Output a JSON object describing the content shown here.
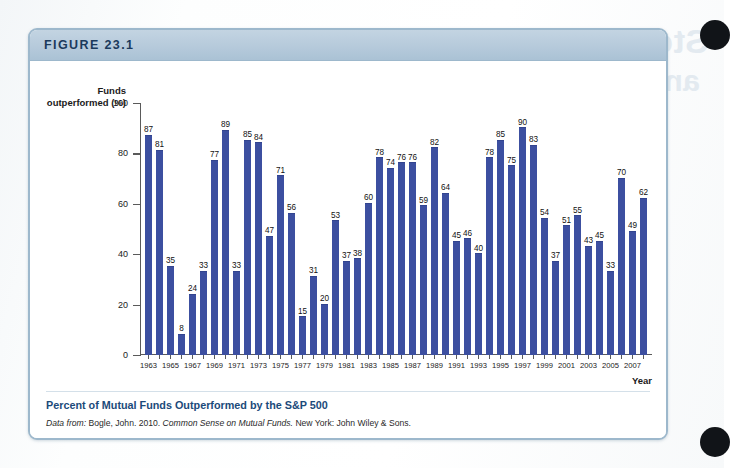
{
  "figure": {
    "header_label": "FIGURE 23.1",
    "caption_title": "Percent of Mutual Funds Outperformed by the S&P 500",
    "source_prefix": "Data from:",
    "source_author": "Bogle, John. 2010.",
    "source_work": "Common Sense on Mutual Funds.",
    "source_publisher": "New York: John Wiley & Sons."
  },
  "bleed_through": {
    "line1": "Stock",
    "line2": "and",
    "line3": "Person",
    "line4": "Fi"
  },
  "colors": {
    "bar": "#3c4fa0",
    "panel_border": "#9db8cc",
    "header_band": "#b6cadb",
    "header_text": "#1b3a5c",
    "caption_title": "#1b4a7a",
    "axis": "#5a5a5a"
  },
  "chart_data": {
    "type": "bar",
    "title": "Percent of Mutual Funds Outperformed by the S&P 500",
    "xlabel": "Year",
    "ylabel": "Funds outperformed (%)",
    "ylim": [
      0,
      100
    ],
    "yticks": [
      0,
      20,
      40,
      60,
      80,
      100
    ],
    "grid": false,
    "legend": "none",
    "value_labels": true,
    "label_interval_x": 2,
    "categories": [
      "1963",
      "1964",
      "1965",
      "1966",
      "1967",
      "1968",
      "1969",
      "1970",
      "1971",
      "1972",
      "1973",
      "1974",
      "1975",
      "1976",
      "1977",
      "1978",
      "1979",
      "1980",
      "1981",
      "1982",
      "1983",
      "1984",
      "1985",
      "1986",
      "1987",
      "1988",
      "1989",
      "1990",
      "1991",
      "1992",
      "1993",
      "1994",
      "1995",
      "1996",
      "1997",
      "1998",
      "1999",
      "2000",
      "2001",
      "2002",
      "2003",
      "2004",
      "2005",
      "2006",
      "2007",
      "2008"
    ],
    "tick_labels": [
      "1963",
      "",
      "1965",
      "",
      "1967",
      "",
      "1969",
      "",
      "1971",
      "",
      "1973",
      "",
      "1975",
      "",
      "1977",
      "",
      "1979",
      "",
      "1981",
      "",
      "1983",
      "",
      "1985",
      "",
      "1987",
      "",
      "1989",
      "",
      "1991",
      "",
      "1993",
      "",
      "1995",
      "",
      "1997",
      "",
      "1999",
      "",
      "2001",
      "",
      "2003",
      "",
      "2005",
      "",
      "2007",
      ""
    ],
    "values": [
      87,
      81,
      35,
      8,
      24,
      33,
      77,
      89,
      33,
      85,
      84,
      47,
      71,
      56,
      15,
      31,
      20,
      53,
      37,
      38,
      60,
      78,
      74,
      76,
      76,
      59,
      82,
      64,
      45,
      46,
      40,
      78,
      85,
      75,
      90,
      83,
      54,
      37,
      51,
      55,
      43,
      45,
      33,
      70,
      49,
      62
    ]
  }
}
